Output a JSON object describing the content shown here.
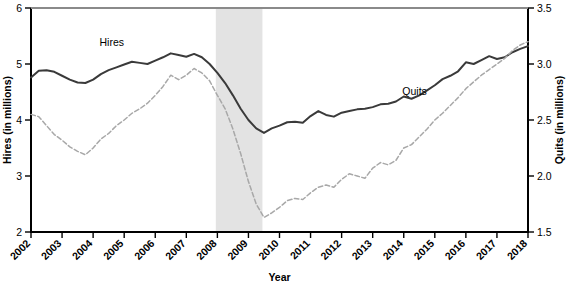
{
  "chart_data": {
    "type": "line",
    "title": "",
    "xlabel": "Year",
    "ylabel": "Hires (in millions)",
    "y2label": "Quits (in millions)",
    "grid": false,
    "legend_position": "inline-annotation",
    "xlim": [
      2002,
      2018
    ],
    "ylim": [
      2,
      6
    ],
    "y2lim": [
      1.5,
      3.5
    ],
    "x_tick_labels": [
      "2002",
      "2003",
      "2004",
      "2005",
      "2006",
      "2007",
      "2008",
      "2009",
      "2010",
      "2011",
      "2012",
      "2013",
      "2014",
      "2015",
      "2016",
      "2017",
      "2018"
    ],
    "y_tick_labels": [
      "2",
      "3",
      "4",
      "5",
      "6"
    ],
    "y_tick_values": [
      2,
      3,
      4,
      5,
      6
    ],
    "y2_tick_labels": [
      "1.5",
      "2.0",
      "2.5",
      "3.0",
      "3.5"
    ],
    "y2_tick_values": [
      1.5,
      2.0,
      2.5,
      3.0,
      3.5
    ],
    "shaded_regions": [
      {
        "name": "recession",
        "x_start": 2007.95,
        "x_end": 2009.45,
        "color": "#e3e3e3"
      }
    ],
    "annotations": [
      {
        "text": "Hires",
        "x": 2004.6,
        "y_axis": "left",
        "y": 5.33
      },
      {
        "text": "Quits",
        "x": 2014.35,
        "y_axis": "right",
        "y": 2.72
      }
    ],
    "series": [
      {
        "name": "Hires",
        "axis": "left",
        "color": "#3a3a3a",
        "style": "solid",
        "x": [
          2002.0,
          2002.25,
          2002.5,
          2002.75,
          2003.0,
          2003.25,
          2003.5,
          2003.75,
          2004.0,
          2004.25,
          2004.5,
          2004.75,
          2005.0,
          2005.25,
          2005.5,
          2005.75,
          2006.0,
          2006.25,
          2006.5,
          2006.75,
          2007.0,
          2007.25,
          2007.5,
          2007.75,
          2008.0,
          2008.25,
          2008.5,
          2008.75,
          2009.0,
          2009.25,
          2009.5,
          2009.75,
          2010.0,
          2010.25,
          2010.5,
          2010.75,
          2011.0,
          2011.25,
          2011.5,
          2011.75,
          2012.0,
          2012.25,
          2012.5,
          2012.75,
          2013.0,
          2013.25,
          2013.5,
          2013.75,
          2014.0,
          2014.25,
          2014.5,
          2014.75,
          2015.0,
          2015.25,
          2015.5,
          2015.75,
          2016.0,
          2016.25,
          2016.5,
          2016.75,
          2017.0,
          2017.25,
          2017.5,
          2017.75,
          2018.0
        ],
        "y": [
          4.76,
          4.88,
          4.89,
          4.86,
          4.79,
          4.72,
          4.67,
          4.66,
          4.72,
          4.82,
          4.89,
          4.94,
          4.99,
          5.04,
          5.02,
          5.0,
          5.06,
          5.12,
          5.19,
          5.16,
          5.13,
          5.18,
          5.12,
          5.0,
          4.84,
          4.66,
          4.44,
          4.2,
          4.0,
          3.85,
          3.77,
          3.85,
          3.9,
          3.96,
          3.97,
          3.95,
          4.07,
          4.16,
          4.09,
          4.06,
          4.13,
          4.16,
          4.19,
          4.2,
          4.23,
          4.28,
          4.29,
          4.33,
          4.42,
          4.38,
          4.44,
          4.53,
          4.62,
          4.73,
          4.79,
          4.87,
          5.03,
          5.0,
          5.07,
          5.14,
          5.09,
          5.12,
          5.21,
          5.27,
          5.32
        ]
      },
      {
        "name": "Quits",
        "axis": "right",
        "color": "#a8a8a8",
        "style": "dashed",
        "x": [
          2002.0,
          2002.25,
          2002.5,
          2002.75,
          2003.0,
          2003.25,
          2003.5,
          2003.75,
          2004.0,
          2004.25,
          2004.5,
          2004.75,
          2005.0,
          2005.25,
          2005.5,
          2005.75,
          2006.0,
          2006.25,
          2006.5,
          2006.75,
          2007.0,
          2007.25,
          2007.5,
          2007.75,
          2008.0,
          2008.25,
          2008.5,
          2008.75,
          2009.0,
          2009.25,
          2009.5,
          2009.75,
          2010.0,
          2010.25,
          2010.5,
          2010.75,
          2011.0,
          2011.25,
          2011.5,
          2011.75,
          2012.0,
          2012.25,
          2012.5,
          2012.75,
          2013.0,
          2013.25,
          2013.5,
          2013.75,
          2014.0,
          2014.25,
          2014.5,
          2014.75,
          2015.0,
          2015.25,
          2015.5,
          2015.75,
          2016.0,
          2016.25,
          2016.5,
          2016.75,
          2017.0,
          2017.25,
          2017.5,
          2017.75,
          2018.0
        ],
        "y": [
          2.55,
          2.53,
          2.45,
          2.37,
          2.32,
          2.26,
          2.22,
          2.19,
          2.25,
          2.33,
          2.38,
          2.45,
          2.5,
          2.56,
          2.6,
          2.65,
          2.72,
          2.8,
          2.9,
          2.86,
          2.9,
          2.96,
          2.92,
          2.85,
          2.72,
          2.6,
          2.42,
          2.2,
          1.95,
          1.75,
          1.63,
          1.67,
          1.72,
          1.78,
          1.8,
          1.79,
          1.85,
          1.9,
          1.92,
          1.9,
          1.97,
          2.02,
          2.0,
          1.98,
          2.07,
          2.12,
          2.1,
          2.14,
          2.25,
          2.28,
          2.35,
          2.42,
          2.5,
          2.56,
          2.63,
          2.7,
          2.78,
          2.84,
          2.9,
          2.95,
          3.0,
          3.05,
          3.12,
          3.17,
          3.2
        ]
      }
    ]
  },
  "axes": {
    "left_title": "Hires (in millions)",
    "right_title": "Quits (in millions)",
    "bottom_title": "Year"
  }
}
